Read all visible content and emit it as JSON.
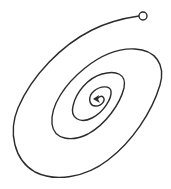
{
  "diagram": {
    "type": "spiral",
    "colors": {
      "stroke": "#2b2b2b",
      "background": "#ffffff",
      "start_fill": "#ffffff"
    },
    "start_marker": {
      "shape": "open-circle",
      "cx": 143,
      "cy": 16,
      "r": 4
    },
    "end_marker": {
      "shape": "arrowhead",
      "x": 95,
      "y": 99,
      "direction": "left"
    },
    "loops": 4
  }
}
